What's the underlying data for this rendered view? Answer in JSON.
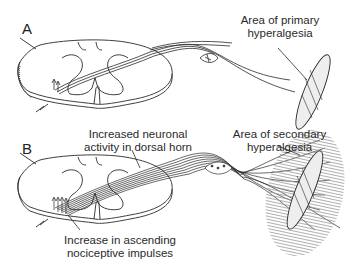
{
  "figure": {
    "panels": [
      {
        "letter": "A",
        "labels": {
          "primary_area_line1": "Area of primary",
          "primary_area_line2": "hyperalgesia"
        }
      },
      {
        "letter": "B",
        "labels": {
          "dorsal_horn_line1": "Increased neuronal",
          "dorsal_horn_line2": "activity in dorsal horn",
          "secondary_area_line1": "Area of secondary",
          "secondary_area_line2": "hyperalgesia",
          "ascending_line1": "Increase in ascending",
          "ascending_line2": "nociceptive impulses"
        }
      }
    ],
    "colors": {
      "ink": "#2a2a2a",
      "background": "#ffffff",
      "hatch": "#9a9a9a"
    }
  }
}
